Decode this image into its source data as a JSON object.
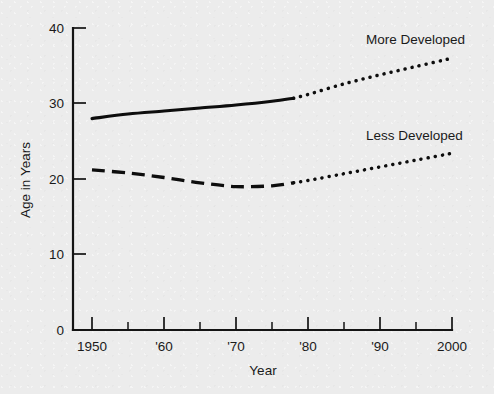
{
  "chart_data": {
    "type": "line",
    "title": "",
    "xlabel": "Year",
    "ylabel": "Age in Years",
    "xlim": [
      1950,
      2000
    ],
    "ylim": [
      0,
      40
    ],
    "grid": false,
    "legend_position": "inline-annotations",
    "x_tick_labels": [
      "1950",
      "'60",
      "'70",
      "'80",
      "'90",
      "2000"
    ],
    "x_tick_values": [
      1950,
      1960,
      1970,
      1980,
      1990,
      2000
    ],
    "x_minor_tick_values": [
      1955,
      1965,
      1975,
      1985,
      1995
    ],
    "y_tick_labels": [
      "0",
      "10",
      "20",
      "30",
      "40"
    ],
    "y_tick_values": [
      0,
      10,
      20,
      30,
      40
    ],
    "series": [
      {
        "name": "More Developed",
        "annotation": "More Developed",
        "style_actual": "solid",
        "style_projected": "dotted",
        "projection_start_year": 1978,
        "x": [
          1950,
          1955,
          1960,
          1965,
          1970,
          1975,
          1978,
          1980,
          1985,
          1990,
          1995,
          2000
        ],
        "values": [
          28.0,
          28.6,
          29.0,
          29.4,
          29.8,
          30.3,
          30.7,
          31.2,
          32.6,
          33.8,
          34.9,
          36.0
        ]
      },
      {
        "name": "Less Developed",
        "annotation": "Less Developed",
        "style_actual": "dashed",
        "style_projected": "dotted",
        "projection_start_year": 1978,
        "x": [
          1950,
          1955,
          1960,
          1965,
          1970,
          1975,
          1978,
          1980,
          1985,
          1990,
          1995,
          2000
        ],
        "values": [
          21.2,
          20.8,
          20.2,
          19.5,
          19.0,
          19.1,
          19.5,
          19.8,
          20.7,
          21.6,
          22.5,
          23.4
        ]
      }
    ]
  },
  "annotations": {
    "more_developed": "More Developed",
    "less_developed": "Less Developed"
  },
  "axes": {
    "x_title": "Year",
    "y_title": "Age in Years"
  },
  "colors": {
    "background": "#ececec",
    "ink": "#0d0d0d",
    "axis": "#141414"
  }
}
